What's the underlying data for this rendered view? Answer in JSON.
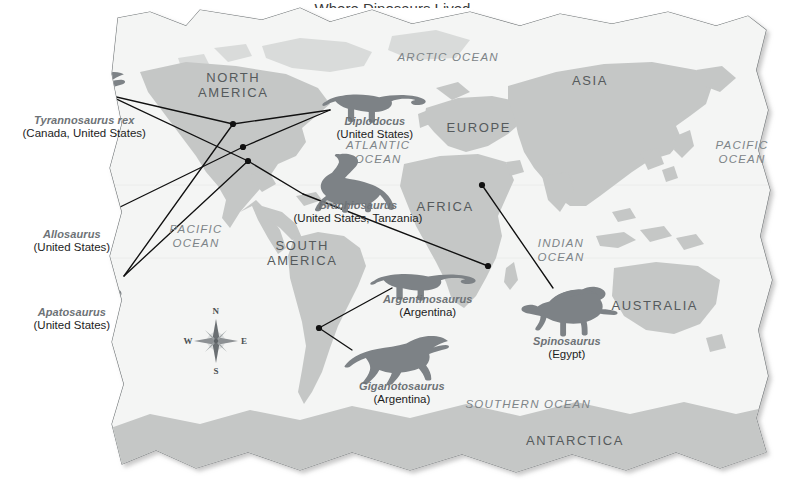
{
  "page": {
    "title_fragment": "Where Dinosaurs Lived",
    "width": 785,
    "height": 489
  },
  "colors": {
    "land": "#c5c7c6",
    "land_light": "#d9dbda",
    "ocean": "#f4f5f4",
    "paper": "#fbfbfa",
    "dino_silhouette": "#7d8286",
    "connector_line": "#111111",
    "marker_dot": "#111111",
    "continent_text": "#555a5c",
    "ocean_text": "#7d8488",
    "genus_text": "#6d7276",
    "location_text": "#1d1d1d"
  },
  "continents": [
    {
      "name": "NORTH\nAMERICA",
      "line1": "NORTH",
      "line2": "AMERICA",
      "x": 233,
      "y": 85
    },
    {
      "name": "SOUTH AMERICA",
      "line1": "SOUTH",
      "line2": "AMERICA",
      "x": 302,
      "y": 253
    },
    {
      "name": "EUROPE",
      "line1": "EUROPE",
      "line2": "",
      "x": 479,
      "y": 127
    },
    {
      "name": "AFRICA",
      "line1": "AFRICA",
      "line2": "",
      "x": 445,
      "y": 206
    },
    {
      "name": "ASIA",
      "line1": "ASIA",
      "line2": "",
      "x": 590,
      "y": 80
    },
    {
      "name": "AUSTRALIA",
      "line1": "AUSTRALIA",
      "line2": "",
      "x": 655,
      "y": 305
    },
    {
      "name": "ANTARCTICA",
      "line1": "ANTARCTICA",
      "line2": "",
      "x": 575,
      "y": 440
    }
  ],
  "oceans": [
    {
      "name": "ARCTIC OCEAN",
      "line1": "ARCTIC OCEAN",
      "line2": "",
      "x": 448,
      "y": 57
    },
    {
      "name": "ATLANTIC OCEAN",
      "line1": "ATLANTIC",
      "line2": "OCEAN",
      "x": 378,
      "y": 152
    },
    {
      "name": "PACIFIC OCEAN (east)",
      "line1": "PACIFIC",
      "line2": "OCEAN",
      "x": 742,
      "y": 152
    },
    {
      "name": "PACIFIC OCEAN (west)",
      "line1": "PACIFIC",
      "line2": "OCEAN",
      "x": 196,
      "y": 236
    },
    {
      "name": "INDIAN OCEAN",
      "line1": "INDIAN",
      "line2": "OCEAN",
      "x": 561,
      "y": 250
    },
    {
      "name": "SOUTHERN OCEAN",
      "line1": "SOUTHERN OCEAN",
      "line2": "",
      "x": 528,
      "y": 404
    }
  ],
  "compass": {
    "cx": 216,
    "cy": 341,
    "north": "N",
    "east": "E",
    "south": "S",
    "west": "W"
  },
  "dinosaurs": [
    {
      "id": "tyrannosaurus-rex",
      "genus": "Tyrannosaurus rex",
      "locations": "(Canada, United States)",
      "label_x": 84,
      "label_y": 126,
      "silhouette": "trex",
      "sil_x": 20,
      "sil_y": 70,
      "sil_w": 106,
      "sil_h": 52,
      "anchor_x": 108,
      "anchor_y": 95,
      "targets": [
        [
          233,
          124
        ],
        [
          248,
          161
        ]
      ]
    },
    {
      "id": "allosaurus",
      "genus": "Allosaurus",
      "locations": "(United States)",
      "label_x": 72,
      "label_y": 240,
      "silhouette": "allosaurus",
      "sil_x": 22,
      "sil_y": 190,
      "sil_w": 94,
      "sil_h": 44,
      "anchor_x": 116,
      "anchor_y": 209,
      "targets": [
        [
          243,
          147
        ]
      ]
    },
    {
      "id": "apatosaurus",
      "genus": "Apatosaurus",
      "locations": "(United States)",
      "label_x": 72,
      "label_y": 318,
      "silhouette": "sauropod-long",
      "sil_x": 12,
      "sil_y": 272,
      "sil_w": 112,
      "sil_h": 46,
      "anchor_x": 124,
      "anchor_y": 276,
      "targets": [
        [
          233,
          124
        ],
        [
          248,
          161
        ]
      ]
    },
    {
      "id": "diplodocus",
      "genus": "Diplodocus",
      "locations": "(United States)",
      "label_x": 375,
      "label_y": 127,
      "silhouette": "sauropod-curl",
      "sil_x": 324,
      "sil_y": 84,
      "sil_w": 104,
      "sil_h": 40,
      "anchor_x": 330,
      "anchor_y": 110,
      "targets": [
        [
          233,
          124
        ],
        [
          243,
          147
        ]
      ]
    },
    {
      "id": "brachiosaurus",
      "genus": "Brachiosaurus",
      "locations": "(United States, Tanzania)",
      "label_x": 358,
      "label_y": 211,
      "silhouette": "brachiosaurus",
      "sil_x": 300,
      "sil_y": 153,
      "sil_w": 100,
      "sil_h": 58,
      "anchor_x": 303,
      "anchor_y": 194,
      "targets": [
        [
          248,
          161
        ],
        [
          488,
          266
        ]
      ]
    },
    {
      "id": "argentinosaurus",
      "genus": "Argentinosaurus",
      "locations": "(Argentina)",
      "label_x": 428,
      "label_y": 305,
      "silhouette": "sauropod-curl",
      "sil_x": 372,
      "sil_y": 264,
      "sil_w": 106,
      "sil_h": 38,
      "anchor_x": 392,
      "anchor_y": 288,
      "targets": [
        [
          319,
          328
        ]
      ]
    },
    {
      "id": "giganotosaurus",
      "genus": "Giganotosaurus",
      "locations": "(Argentina)",
      "label_x": 402,
      "label_y": 392,
      "silhouette": "theropod-big",
      "sil_x": 345,
      "sil_y": 334,
      "sil_w": 104,
      "sil_h": 50,
      "anchor_x": 352,
      "anchor_y": 350,
      "targets": [
        [
          319,
          328
        ]
      ]
    },
    {
      "id": "spinosaurus",
      "genus": "Spinosaurus",
      "locations": "(Egypt)",
      "label_x": 567,
      "label_y": 347,
      "silhouette": "spinosaurus",
      "sil_x": 520,
      "sil_y": 283,
      "sil_w": 98,
      "sil_h": 56,
      "anchor_x": 553,
      "anchor_y": 288,
      "targets": [
        [
          482,
          185
        ]
      ]
    }
  ],
  "markers": [
    {
      "name": "canada-marker",
      "x": 233,
      "y": 124
    },
    {
      "name": "western-us-marker",
      "x": 243,
      "y": 147
    },
    {
      "name": "us-marker",
      "x": 248,
      "y": 161
    },
    {
      "name": "argentina-marker",
      "x": 319,
      "y": 328
    },
    {
      "name": "egypt-marker",
      "x": 482,
      "y": 185
    },
    {
      "name": "tanzania-marker",
      "x": 488,
      "y": 266
    }
  ]
}
